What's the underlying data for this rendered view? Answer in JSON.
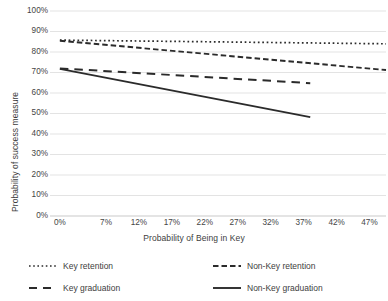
{
  "chart_data": {
    "type": "line",
    "title": "",
    "xlabel": "Probability of Being in Key",
    "ylabel": "Probability of success measure",
    "x_tick_labels": [
      "0%",
      "7%",
      "12%",
      "17%",
      "22%",
      "27%",
      "32%",
      "37%",
      "42%",
      "47%"
    ],
    "x_tick_values": [
      0,
      7,
      12,
      17,
      22,
      27,
      32,
      37,
      42,
      47
    ],
    "y_tick_labels": [
      "0%",
      "10%",
      "20%",
      "30%",
      "40%",
      "50%",
      "60%",
      "70%",
      "80%",
      "90%",
      "100%"
    ],
    "y_tick_values": [
      0,
      10,
      20,
      30,
      40,
      50,
      60,
      70,
      80,
      90,
      100
    ],
    "xlim": [
      -1.5,
      49.5
    ],
    "ylim": [
      0,
      100
    ],
    "grid": "horizontal",
    "legend_position": "bottom",
    "line_color": "#2b2b2b",
    "grid_color": "#e3e3e3",
    "series": [
      {
        "name": "Key retention",
        "style": "dotted",
        "x": [
          0,
          49.5
        ],
        "y": [
          85.8,
          84.0
        ]
      },
      {
        "name": "Non-Key retention",
        "style": "dashed",
        "x": [
          0,
          49.5
        ],
        "y": [
          85.5,
          71.2
        ]
      },
      {
        "name": "Key graduation",
        "style": "dashed-long",
        "x": [
          0,
          38.0
        ],
        "y": [
          72.0,
          64.8
        ]
      },
      {
        "name": "Non-Key graduation",
        "style": "solid",
        "x": [
          0,
          38.0
        ],
        "y": [
          71.8,
          48.2
        ]
      }
    ]
  },
  "legend": {
    "key_retention": "Key retention",
    "key_graduation": "Key graduation",
    "nonkey_retention": "Non-Key retention",
    "nonkey_graduation": "Non-Key graduation"
  }
}
